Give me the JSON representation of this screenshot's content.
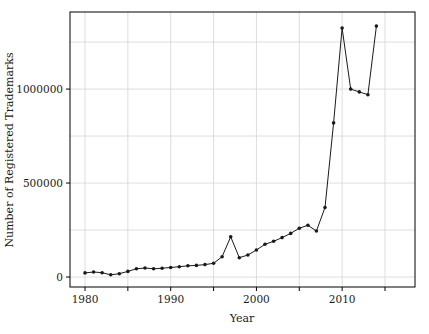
{
  "chart_data": {
    "type": "line",
    "title": "",
    "xlabel": "Year",
    "ylabel": "Number of Registered Trademarks",
    "x": [
      1980,
      1981,
      1982,
      1983,
      1984,
      1985,
      1986,
      1987,
      1988,
      1989,
      1990,
      1991,
      1992,
      1993,
      1994,
      1995,
      1996,
      1997,
      1998,
      1999,
      2000,
      2001,
      2002,
      2003,
      2004,
      2005,
      2006,
      2007,
      2008,
      2009,
      2010,
      2011,
      2012,
      2013,
      2014
    ],
    "values": [
      22000,
      27000,
      23000,
      12000,
      18000,
      30000,
      44000,
      48000,
      44000,
      47000,
      51000,
      55000,
      60000,
      62000,
      66000,
      73000,
      108000,
      214000,
      103000,
      117000,
      144000,
      174000,
      190000,
      210000,
      232000,
      260000,
      275000,
      245000,
      370000,
      820000,
      1325000,
      1000000,
      985000,
      970000,
      1335000
    ],
    "xlim": [
      1978.25,
      2018.5
    ],
    "ylim": [
      -53000,
      1410000
    ],
    "grid": true,
    "legend": false,
    "x_gridlines": [
      1980,
      1985,
      1990,
      1995,
      2000,
      2005,
      2010,
      2015
    ],
    "y_gridlines": [
      0,
      250000,
      500000,
      750000,
      1000000,
      1250000
    ],
    "x_ticks": [
      1980,
      1985,
      1990,
      1995,
      2000,
      2005,
      2010,
      2015
    ],
    "x_tick_labels": [
      {
        "value": 1980,
        "label": "1980"
      },
      {
        "value": 1990,
        "label": "1990"
      },
      {
        "value": 2000,
        "label": "2000"
      },
      {
        "value": 2010,
        "label": "2010"
      }
    ],
    "y_tick_labels": [
      {
        "value": 0,
        "label": "0"
      },
      {
        "value": 500000,
        "label": "500000"
      },
      {
        "value": 1000000,
        "label": "1000000"
      }
    ],
    "colors": {
      "line": "#1a1a1a",
      "marker": "#1a1a1a",
      "grid": "#d4d4d4",
      "frame": "#000000",
      "background": "#ffffff",
      "text": "#1a1a1a"
    }
  }
}
